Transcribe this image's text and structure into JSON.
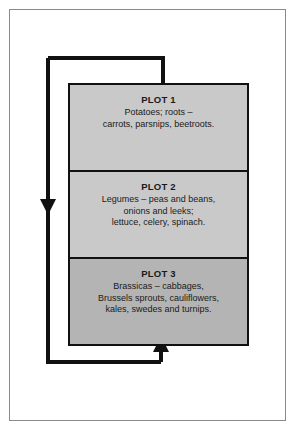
{
  "diagram": {
    "type": "crop-rotation-cycle",
    "title": "",
    "frame": {
      "border_color": "#8a8a8a",
      "background": "#ffffff"
    },
    "colors": {
      "plot_light": "#c9c9c9",
      "plot_dark": "#b4b4b4",
      "outline": "#111111",
      "arrow": "#111111",
      "text": "#1a1a1a"
    },
    "plots": [
      {
        "id": "plot-1",
        "title": "PLOT 1",
        "lines": [
          "Potatoes; roots –",
          "carrots, parsnips, beetroots."
        ],
        "fill": "#c9c9c9"
      },
      {
        "id": "plot-2",
        "title": "PLOT 2",
        "lines": [
          "Legumes – peas and beans,",
          "onions and leeks;",
          "lettuce, celery, spinach."
        ],
        "fill": "#c9c9c9"
      },
      {
        "id": "plot-3",
        "title": "PLOT 3",
        "lines": [
          "Brassicas – cabbages,",
          "Brussels sprouts, cauliflowers,",
          "kales, swedes and turnips."
        ],
        "fill": "#b4b4b4"
      }
    ],
    "arrows": [
      {
        "id": "arrow-plot3-to-plot2",
        "direction": "up",
        "from": "plot-3",
        "to": "plot-2"
      },
      {
        "id": "arrow-plot2-to-plot1",
        "direction": "up",
        "from": "plot-2",
        "to": "plot-1"
      },
      {
        "id": "arrow-loop-return",
        "direction": "up",
        "from": "plot-1",
        "to": "plot-3"
      }
    ]
  }
}
